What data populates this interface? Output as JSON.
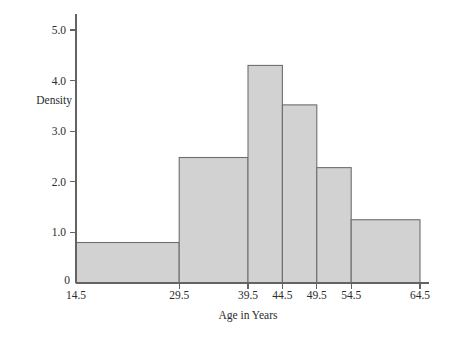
{
  "chart_data": {
    "type": "bar",
    "title": "",
    "xlabel": "Age in Years",
    "ylabel": "Density",
    "grid": false,
    "legend": "none",
    "xlim": [
      14.5,
      64.5
    ],
    "ylim": [
      0,
      5.4
    ],
    "x_tick_labels": [
      "14.5",
      "29.5",
      "39.5",
      "44.5",
      "49.5",
      "54.5",
      "64.5"
    ],
    "x_tick_values": [
      14.5,
      29.5,
      39.5,
      44.5,
      49.5,
      54.5,
      64.5
    ],
    "y_tick_labels": [
      "1.0",
      "2.0",
      "3.0",
      "4.0",
      "5.0"
    ],
    "y_tick_values": [
      1.0,
      2.0,
      3.0,
      4.0,
      5.0
    ],
    "zero_label": "0",
    "bin_edges": [
      14.5,
      29.5,
      39.5,
      44.5,
      49.5,
      54.5,
      64.5
    ],
    "values": [
      0.8,
      2.48,
      4.3,
      3.52,
      2.28,
      1.25
    ],
    "categories": [
      "14.5-29.5",
      "29.5-39.5",
      "39.5-44.5",
      "44.5-49.5",
      "49.5-54.5",
      "54.5-64.5"
    ],
    "bar_fill_color": "#d2d2d2",
    "bar_stroke_color": "#6e6e6e",
    "axis_color": "#636363",
    "text_color": "#2b2b2b"
  }
}
